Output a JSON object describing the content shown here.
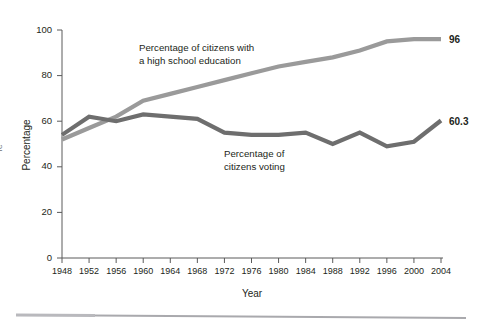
{
  "chart_data": {
    "type": "line",
    "title": "",
    "xlabel": "Year",
    "ylabel": "Percentage",
    "xlim": [
      1948,
      2004
    ],
    "ylim": [
      0,
      100
    ],
    "yticks": [
      0,
      20,
      40,
      60,
      80,
      100
    ],
    "grid": false,
    "legend_position": "inline-annotations",
    "x": [
      1948,
      1952,
      1956,
      1960,
      1964,
      1968,
      1972,
      1976,
      1980,
      1984,
      1988,
      1992,
      1996,
      2000,
      2004
    ],
    "xtick_labels": [
      "1948",
      "1952",
      "1956",
      "1960",
      "1964",
      "1968",
      "1972",
      "1976",
      "1980",
      "1984",
      "1988",
      "1992",
      "1996",
      "2000",
      "2004"
    ],
    "series": [
      {
        "name": "Percentage of citizens with a high school education",
        "color": "#9a9a9a",
        "values": [
          52,
          57,
          62,
          69,
          72,
          75,
          78,
          81,
          84,
          86,
          88,
          91,
          95,
          96,
          96
        ],
        "end_label": "96"
      },
      {
        "name": "Percentage of citizens voting",
        "color": "#6e6e6e",
        "values": [
          54,
          62,
          60,
          63,
          62,
          61,
          55,
          54,
          54,
          55,
          50,
          55,
          49,
          51,
          60.3
        ],
        "end_label": "60.3"
      }
    ],
    "annotations": [
      {
        "id": "education-annotation",
        "line1": "Percentage of citizens with",
        "line2": "a high school education"
      },
      {
        "id": "voting-annotation",
        "line1": "Percentage of",
        "line2": "citizens voting"
      }
    ]
  },
  "edge": {
    "cropped_left_text": "re"
  }
}
